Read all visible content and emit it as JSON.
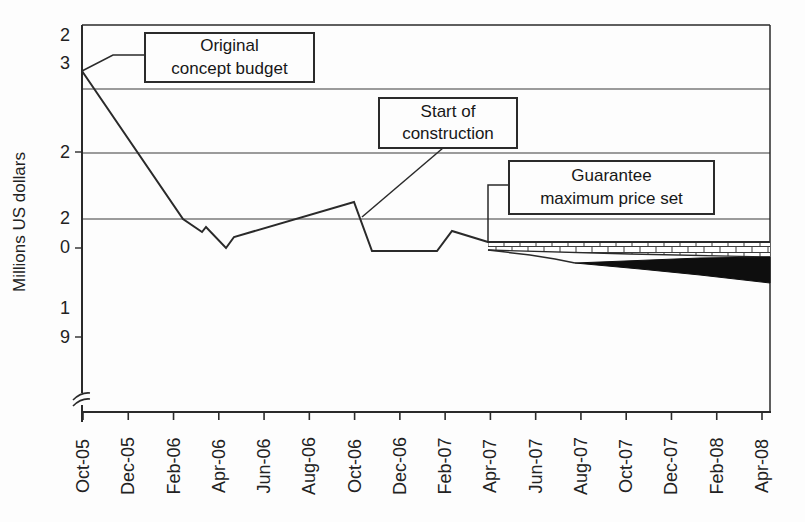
{
  "figure": {
    "ylabel": "Millions US dollars",
    "annotations": [
      {
        "id": "original-concept-budget",
        "lines": [
          "Original",
          "concept budget"
        ]
      },
      {
        "id": "start-of-construction",
        "lines": [
          "Start of",
          "construction"
        ]
      },
      {
        "id": "guarantee-maximum-price",
        "lines": [
          "Guarantee",
          "maximum price set"
        ]
      }
    ]
  },
  "chart_data": {
    "type": "line",
    "title": "",
    "xlabel": "",
    "ylabel": "Millions US dollars",
    "x_categories": [
      "Oct-05",
      "Dec-05",
      "Feb-06",
      "Apr-06",
      "Jun-06",
      "Aug-06",
      "Oct-06",
      "Dec-06",
      "Feb-07",
      "Apr-07",
      "Jun-07",
      "Aug-07",
      "Oct-07",
      "Dec-07",
      "Feb-08",
      "Apr-08"
    ],
    "ytick_digits_as_printed": [
      "2",
      "3",
      "2",
      "2",
      "0",
      "1",
      "9"
    ],
    "ytick_values_interpreted": [
      23,
      21,
      20,
      19
    ],
    "y_axis_break": true,
    "grid": "horizontal",
    "legend": "none",
    "series": [
      {
        "name": "cost-estimate-line",
        "points": [
          [
            "Oct-05",
            22.6
          ],
          [
            "Mar-06",
            20.2
          ],
          [
            "Mar-06",
            20.0
          ],
          [
            "Apr-06",
            19.8
          ],
          [
            "May-06",
            19.9
          ],
          [
            "Oct-06",
            20.5
          ],
          [
            "Nov-06",
            19.7
          ],
          [
            "Jan-07",
            19.7
          ],
          [
            "Feb-07",
            20.0
          ],
          [
            "Apr-07",
            19.9
          ]
        ]
      },
      {
        "name": "guaranteed-maximum-price-line",
        "points": [
          [
            "Apr-07",
            19.9
          ],
          [
            "Apr-08",
            19.9
          ]
        ]
      },
      {
        "name": "forecast-lower-bound",
        "points": [
          [
            "Apr-07",
            19.9
          ],
          [
            "Jun-07",
            19.8
          ],
          [
            "Oct-07",
            19.5
          ],
          [
            "Apr-08",
            19.2
          ]
        ]
      }
    ],
    "bands": [
      {
        "name": "brick-hatched-band",
        "from": "Apr-07",
        "to": "Apr-08",
        "style": "brick-hatch"
      },
      {
        "name": "black-wedge-band",
        "from": "Jun-07",
        "to": "Apr-08",
        "style": "solid-black"
      }
    ],
    "annotations": [
      "Original concept budget",
      "Start of construction",
      "Guarantee maximum price set"
    ]
  },
  "render": {
    "canvas": {
      "w": 805,
      "h": 522
    },
    "plot": {
      "left": 82,
      "top": 25,
      "right": 770,
      "bottom": 412
    },
    "gridlines_y": [
      89,
      153,
      219
    ],
    "x_first_tick": 83,
    "x_last_tick": 762,
    "x_label_center_y": 466,
    "y_axis_ticks": [
      152,
      248,
      337
    ],
    "y_digit_labels": [
      {
        "text": "2",
        "y": 35
      },
      {
        "text": "3",
        "y": 63
      },
      {
        "text": "2",
        "y": 152
      },
      {
        "text": "2",
        "y": 218
      },
      {
        "text": "0",
        "y": 247
      },
      {
        "text": "1",
        "y": 308
      },
      {
        "text": "9",
        "y": 337
      }
    ],
    "main_line": [
      [
        82,
        71
      ],
      [
        183,
        219
      ],
      [
        202,
        232
      ],
      [
        206,
        227
      ],
      [
        226,
        248
      ],
      [
        234,
        237
      ],
      [
        354,
        202
      ],
      [
        372,
        251
      ],
      [
        437,
        251
      ],
      [
        452,
        231
      ],
      [
        488,
        242
      ]
    ],
    "gmp_line": [
      [
        488,
        242
      ],
      [
        770,
        242
      ]
    ],
    "brick_band": {
      "top": [
        [
          488,
          242
        ],
        [
          770,
          242
        ]
      ],
      "bottom": [
        [
          488,
          250
        ],
        [
          630,
          254
        ],
        [
          770,
          257
        ]
      ]
    },
    "descent_curve": [
      [
        488,
        250
      ],
      [
        530,
        255
      ],
      [
        555,
        259
      ],
      [
        575,
        263
      ]
    ],
    "black_wedge": {
      "top": [
        [
          575,
          263
        ],
        [
          650,
          260
        ],
        [
          700,
          258
        ],
        [
          770,
          257
        ]
      ],
      "bottom": [
        [
          575,
          263
        ],
        [
          640,
          269
        ],
        [
          700,
          275
        ],
        [
          770,
          283
        ]
      ]
    },
    "leaders": [
      [
        [
          82,
          71
        ],
        [
          113,
          55
        ],
        [
          144,
          55
        ]
      ],
      [
        [
          443,
          148
        ],
        [
          362,
          217
        ]
      ],
      [
        [
          508,
          185
        ],
        [
          488,
          185
        ],
        [
          488,
          243
        ]
      ]
    ],
    "boxes": [
      {
        "id": "original-concept-budget",
        "x": 144,
        "y": 32,
        "w": 171,
        "h": 51
      },
      {
        "id": "start-of-construction",
        "x": 378,
        "y": 97,
        "w": 140,
        "h": 52
      },
      {
        "id": "guarantee-maximum-price",
        "x": 508,
        "y": 160,
        "w": 207,
        "h": 55
      }
    ],
    "axis_break": {
      "y": 399
    },
    "colors": {
      "ink": "#2a2a2a",
      "grid": "#3a3a3a",
      "black_fill": "#0e0e0e",
      "bg": "#fdfdfd"
    }
  }
}
